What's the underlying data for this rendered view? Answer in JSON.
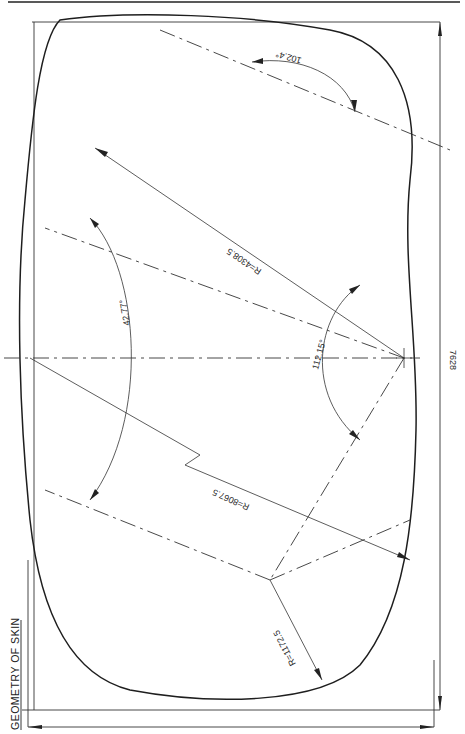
{
  "title": "GEOMETRY OF SKIN",
  "colors": {
    "ink": "#1e1e1e",
    "paper": "#ffffff"
  },
  "dimensions": {
    "overall_width": "7628",
    "radius_large": "R=8067.5",
    "radius_medium": "R=4308.5",
    "radius_small": "R=1172.5"
  },
  "angles": {
    "top_angle": "102.4°",
    "left_angle": "42.77°",
    "center_angle": "112.15°"
  }
}
